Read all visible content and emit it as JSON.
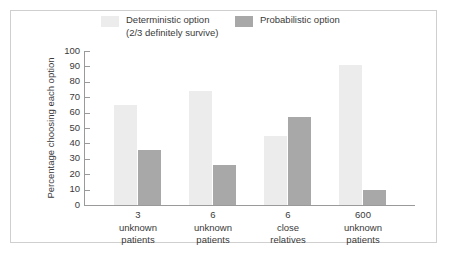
{
  "figure": {
    "background_color": "#ffffff",
    "frame_color": "#cfcfcf",
    "axis_color": "#9a9a9a",
    "text_color": "#3a3a3a"
  },
  "legend": {
    "entries": [
      {
        "label_line1": "Deterministic option",
        "label_line2": "(2/3 definitely survive)",
        "color": "#ececec",
        "swatch_name": "legend-swatch-deterministic"
      },
      {
        "label_line1": "Probabilistic option",
        "label_line2": "",
        "color": "#a8a8a8",
        "swatch_name": "legend-swatch-probabilistic"
      }
    ]
  },
  "chart_data": {
    "type": "bar",
    "title": "",
    "xlabel": "",
    "ylabel": "Percentage choosing each option",
    "ylim": [
      0,
      100
    ],
    "yticks": [
      0,
      10,
      20,
      30,
      40,
      50,
      60,
      70,
      80,
      90,
      100
    ],
    "grid": false,
    "legend_position": "top",
    "categories": [
      "3\nunknown\npatients",
      "6\nunknown\npatients",
      "6\nclose\nrelatives",
      "600\nunknown\npatients"
    ],
    "series": [
      {
        "name": "Deterministic option (2/3 definitely survive)",
        "color": "#ececec",
        "values": [
          65,
          74,
          45,
          91
        ]
      },
      {
        "name": "Probabilistic option",
        "color": "#a8a8a8",
        "values": [
          36,
          26,
          57,
          9.5
        ]
      }
    ]
  }
}
